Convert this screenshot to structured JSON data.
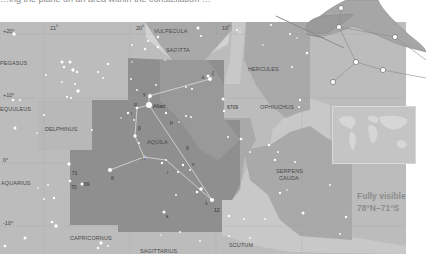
{
  "heading": {
    "text": "…ing the plane on an area within the constellation …"
  },
  "map": {
    "title": "Aquila star chart",
    "colors": {
      "background": "#bcbcbc",
      "neighbor_region": "#a8a8a8",
      "aquila_region": "#8f8f8f",
      "milky_way": "#d2d2d2",
      "grid_line": "#9a9a9a",
      "star": "#ffffff",
      "constellation_line": "#e6e6e6"
    },
    "ra_labels": [
      {
        "text": "21h",
        "x": 50,
        "y": 27
      },
      {
        "text": "20h",
        "x": 136,
        "y": 27
      },
      {
        "text": "19h",
        "x": 222,
        "y": 27
      }
    ],
    "dec_labels": [
      {
        "text": "+20°",
        "x": 3,
        "y": 31
      },
      {
        "text": "+10°",
        "x": 3,
        "y": 95
      },
      {
        "text": "0°",
        "x": 3,
        "y": 160
      },
      {
        "text": "-10°",
        "x": 3,
        "y": 223
      }
    ],
    "constellations": [
      {
        "name": "VULPECULA",
        "x": 154,
        "y": 28
      },
      {
        "name": "SAGITTA",
        "x": 166,
        "y": 48
      },
      {
        "name": "PEGASUS",
        "x": 0,
        "y": 61
      },
      {
        "name": "HERCULES",
        "x": 248,
        "y": 67
      },
      {
        "name": "EQUULEUS",
        "x": 0,
        "y": 107
      },
      {
        "name": "OPHIUCHUS",
        "x": 260,
        "y": 105
      },
      {
        "name": "DELPHINUS",
        "x": 45,
        "y": 127
      },
      {
        "name": "AQUILA",
        "x": 147,
        "y": 140
      },
      {
        "name": "AQUARIUS",
        "x": 1,
        "y": 181
      },
      {
        "name": "SERPENS",
        "x": 276,
        "y": 169
      },
      {
        "name": "CAUDA",
        "x": 279,
        "y": 176
      },
      {
        "name": "CAPRICORNUS",
        "x": 70,
        "y": 236
      },
      {
        "name": "SCUTUM",
        "x": 229,
        "y": 243
      },
      {
        "name": "SAGITTARIUS",
        "x": 140,
        "y": 249
      }
    ],
    "star_labels": [
      {
        "text": "Altair",
        "x": 148,
        "y": 105
      },
      {
        "text": "γ",
        "x": 143,
        "y": 95
      },
      {
        "text": "α",
        "x": 134,
        "y": 103
      },
      {
        "text": "ζ",
        "x": 210,
        "y": 70
      },
      {
        "text": "ε",
        "x": 202,
        "y": 75
      },
      {
        "text": "6709",
        "x": 229,
        "y": 104
      },
      {
        "text": "μ",
        "x": 170,
        "y": 121
      },
      {
        "text": "β",
        "x": 138,
        "y": 127
      },
      {
        "text": "ι",
        "x": 133,
        "y": 111
      },
      {
        "text": "η",
        "x": 142,
        "y": 155
      },
      {
        "text": "θ",
        "x": 111,
        "y": 176
      },
      {
        "text": "δ",
        "x": 186,
        "y": 146
      },
      {
        "text": "λ",
        "x": 205,
        "y": 201
      },
      {
        "text": "12",
        "x": 214,
        "y": 209
      },
      {
        "text": "ι",
        "x": 167,
        "y": 170
      },
      {
        "text": "κ",
        "x": 166,
        "y": 215
      },
      {
        "text": "71",
        "x": 72,
        "y": 172
      },
      {
        "text": "70",
        "x": 71,
        "y": 185
      },
      {
        "text": "69",
        "x": 84,
        "y": 182
      },
      {
        "text": "ν",
        "x": 192,
        "y": 162
      }
    ],
    "stars": [
      [
        14,
        34,
        2.2
      ],
      [
        13,
        100,
        1.8
      ],
      [
        20,
        100,
        1.3
      ],
      [
        62,
        62,
        2
      ],
      [
        70,
        62,
        2
      ],
      [
        64,
        67,
        1.6
      ],
      [
        73,
        70,
        2.2
      ],
      [
        77,
        72,
        1.6
      ],
      [
        46,
        75,
        1.2
      ],
      [
        75,
        84,
        1.4
      ],
      [
        62,
        82,
        1.2
      ],
      [
        78,
        91,
        2.4
      ],
      [
        71,
        98,
        1.3
      ],
      [
        67,
        97,
        1.4
      ],
      [
        98,
        72,
        1.4
      ],
      [
        108,
        64,
        1.6
      ],
      [
        103,
        78,
        1.2
      ],
      [
        44,
        115,
        1.3
      ],
      [
        15,
        128,
        2
      ],
      [
        37,
        133,
        1.1
      ],
      [
        92,
        130,
        1.2
      ],
      [
        69,
        164,
        2.2
      ],
      [
        70,
        181,
        1.8
      ],
      [
        82,
        184,
        2
      ],
      [
        48,
        185,
        1.2
      ],
      [
        38,
        188,
        1
      ],
      [
        54,
        198,
        1.6
      ],
      [
        44,
        199,
        1.2
      ],
      [
        52,
        222,
        1.8
      ],
      [
        56,
        226,
        2.4
      ],
      [
        25,
        238,
        2
      ],
      [
        5,
        246,
        1.8
      ],
      [
        101,
        243,
        2.2
      ],
      [
        98,
        248,
        1.6
      ],
      [
        108,
        246,
        1.2
      ],
      [
        149,
        105,
        4
      ],
      [
        150,
        96,
        2.6
      ],
      [
        137,
        108,
        1.8
      ],
      [
        134,
        120,
        1.2
      ],
      [
        135,
        136,
        2.2
      ],
      [
        128,
        113,
        1.6
      ],
      [
        121,
        118,
        1
      ],
      [
        139,
        143,
        1.2
      ],
      [
        144,
        157,
        2
      ],
      [
        110,
        170,
        2.8
      ],
      [
        162,
        163,
        1.6
      ],
      [
        166,
        160,
        1.2
      ],
      [
        178,
        172,
        1.4
      ],
      [
        183,
        165,
        1.6
      ],
      [
        197,
        192,
        1.8
      ],
      [
        201,
        189,
        2.4
      ],
      [
        212,
        200,
        2.8
      ],
      [
        190,
        170,
        1.2
      ],
      [
        176,
        195,
        1.2
      ],
      [
        164,
        212,
        2
      ],
      [
        180,
        232,
        1.2
      ],
      [
        161,
        235,
        1
      ],
      [
        200,
        241,
        1.2
      ],
      [
        210,
        79,
        2.6
      ],
      [
        208,
        76,
        2
      ],
      [
        186,
        87,
        1.2
      ],
      [
        192,
        89,
        1.4
      ],
      [
        156,
        85,
        1.2
      ],
      [
        131,
        79,
        1.2
      ],
      [
        137,
        90,
        1.2
      ],
      [
        166,
        113,
        1.6
      ],
      [
        186,
        116,
        1.4
      ],
      [
        191,
        117,
        1.2
      ],
      [
        179,
        122,
        1
      ],
      [
        145,
        49,
        1.6
      ],
      [
        148,
        41,
        1.4
      ],
      [
        158,
        47,
        1.8
      ],
      [
        158,
        37,
        1.6
      ],
      [
        198,
        28,
        2
      ],
      [
        201,
        36,
        1.4
      ],
      [
        177,
        51,
        1
      ],
      [
        165,
        60,
        1
      ],
      [
        132,
        45,
        1.2
      ],
      [
        132,
        62,
        1
      ],
      [
        223,
        99,
        2
      ],
      [
        224,
        111,
        1.6
      ],
      [
        237,
        30,
        1.4
      ],
      [
        240,
        32,
        1
      ],
      [
        271,
        25,
        1.4
      ],
      [
        290,
        34,
        1.4
      ],
      [
        297,
        38,
        1
      ],
      [
        263,
        45,
        1
      ],
      [
        307,
        53,
        1.6
      ],
      [
        292,
        67,
        1.3
      ],
      [
        300,
        100,
        1.6
      ],
      [
        299,
        107,
        1.3
      ],
      [
        228,
        137,
        1.3
      ],
      [
        241,
        139,
        1.8
      ],
      [
        269,
        145,
        1.8
      ],
      [
        275,
        160,
        1.6
      ],
      [
        278,
        152,
        1.3
      ],
      [
        295,
        162,
        1.3
      ],
      [
        280,
        193,
        1.6
      ],
      [
        287,
        190,
        1
      ],
      [
        303,
        213,
        2
      ],
      [
        330,
        185,
        1.2
      ],
      [
        340,
        234,
        1.2
      ],
      [
        346,
        217,
        1.6
      ],
      [
        250,
        152,
        1.2
      ],
      [
        229,
        216,
        1.8
      ],
      [
        244,
        219,
        1.2
      ],
      [
        229,
        236,
        1.2
      ],
      [
        250,
        238,
        1.2
      ],
      [
        265,
        219,
        1.2
      ]
    ],
    "constellation_lines": [
      [
        [
          149,
          96
        ],
        [
          210,
          79
        ]
      ],
      [
        [
          149,
          96
        ],
        [
          149,
          105
        ]
      ],
      [
        [
          149,
          105
        ],
        [
          137,
          108
        ]
      ],
      [
        [
          137,
          108
        ],
        [
          135,
          136
        ]
      ],
      [
        [
          135,
          136
        ],
        [
          144,
          157
        ]
      ],
      [
        [
          144,
          157
        ],
        [
          110,
          170
        ]
      ],
      [
        [
          144,
          157
        ],
        [
          166,
          160
        ]
      ],
      [
        [
          166,
          160
        ],
        [
          212,
          200
        ]
      ],
      [
        [
          149,
          105
        ],
        [
          212,
          200
        ]
      ],
      [
        [
          212,
          200
        ],
        [
          201,
          189
        ]
      ]
    ]
  },
  "eagle_figure": {
    "description": "eagle-illustration",
    "stick_points": [
      [
        343,
        8
      ],
      [
        340,
        27
      ],
      [
        395,
        37
      ],
      [
        356,
        62
      ],
      [
        383,
        70
      ],
      [
        333,
        82
      ],
      [
        426,
        78
      ]
    ]
  },
  "inset": {
    "label": "world-map-visibility-inset"
  },
  "visibility": {
    "line1": "Fully visible",
    "line2": "78°N–71°S"
  }
}
